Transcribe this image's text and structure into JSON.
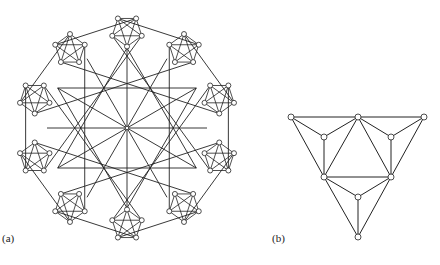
{
  "figure": {
    "panel_a": {
      "label": "(a)",
      "center": [
        127,
        128
      ],
      "cluster_count": 10,
      "cluster_radius_from_center": 97,
      "pentagon_radius": 15.5,
      "spoke_count": 12,
      "spoke_radius": 80
    },
    "panel_b": {
      "label": "(b)",
      "nodes": [
        [
          291,
          117
        ],
        [
          358,
          117
        ],
        [
          424,
          117
        ],
        [
          324,
          137
        ],
        [
          391,
          137
        ],
        [
          324,
          177
        ],
        [
          391,
          177
        ],
        [
          358,
          197
        ],
        [
          358,
          237
        ]
      ],
      "edges": [
        [
          0,
          1
        ],
        [
          1,
          2
        ],
        [
          0,
          3
        ],
        [
          3,
          1
        ],
        [
          1,
          4
        ],
        [
          4,
          2
        ],
        [
          0,
          5
        ],
        [
          3,
          5
        ],
        [
          1,
          5
        ],
        [
          1,
          6
        ],
        [
          4,
          6
        ],
        [
          2,
          6
        ],
        [
          5,
          6
        ],
        [
          5,
          7
        ],
        [
          6,
          7
        ],
        [
          5,
          8
        ],
        [
          6,
          8
        ],
        [
          7,
          8
        ]
      ]
    },
    "colors": {
      "stroke": "#222222",
      "node_fill": "#ffffff"
    }
  }
}
